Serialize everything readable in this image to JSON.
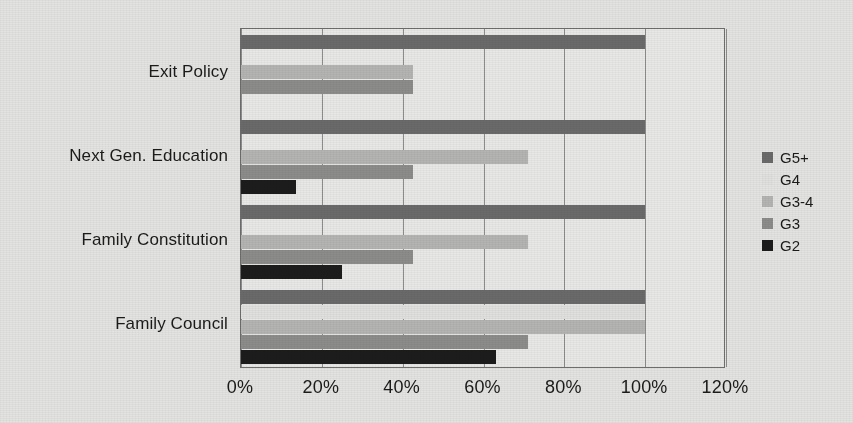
{
  "chart_data": {
    "type": "bar",
    "orientation": "horizontal",
    "title": "",
    "xlabel": "",
    "ylabel": "",
    "xlim": [
      0,
      120
    ],
    "xtick_labels": [
      "0%",
      "20%",
      "40%",
      "60%",
      "80%",
      "100%",
      "120%"
    ],
    "xtick_values": [
      0,
      20,
      40,
      60,
      80,
      100,
      120
    ],
    "grid": "vertical",
    "legend_position": "right",
    "categories": [
      "Exit Policy",
      "Next Gen. Education",
      "Family Constitution",
      "Family Council"
    ],
    "series": [
      {
        "name": "G5+",
        "color": "#6a6a6a",
        "values": [
          100,
          100,
          100,
          100
        ]
      },
      {
        "name": "G4",
        "color": "#e0e0de",
        "values": [
          0,
          0,
          0,
          100
        ]
      },
      {
        "name": "G3-4",
        "color": "#b4b4b2",
        "values": [
          42.5,
          71,
          71,
          100
        ]
      },
      {
        "name": "G3",
        "color": "#8c8c8a",
        "values": [
          42.5,
          42.5,
          42.5,
          71
        ]
      },
      {
        "name": "G2",
        "color": "#1c1c1c",
        "values": [
          0,
          13.5,
          25,
          63
        ]
      }
    ]
  },
  "legend": {
    "items": [
      {
        "label": "G5+",
        "color": "#6a6a6a"
      },
      {
        "label": "G4",
        "color": "#e0e0de"
      },
      {
        "label": "G3-4",
        "color": "#b4b4b2"
      },
      {
        "label": "G3",
        "color": "#8c8c8a"
      },
      {
        "label": "G2",
        "color": "#1c1c1c"
      }
    ]
  },
  "colors": {
    "page_background": "#e3e3e1",
    "plot_background": "#e8e8e6",
    "axis": "#6e6e6e",
    "gridline": "#8d8d8d",
    "text": "#1b1b1b"
  }
}
